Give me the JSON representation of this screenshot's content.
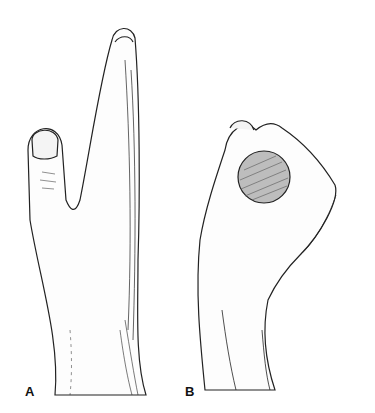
{
  "figure": {
    "panels": [
      {
        "label": "A",
        "description": "Hand with fingers extended flat, thumb abducted"
      },
      {
        "label": "B",
        "description": "Hand grasping a round object between thumb and fingers"
      }
    ],
    "signature": "J.J."
  },
  "colors": {
    "ink": "#222222",
    "background": "#ffffff",
    "object_fill": "#bdbdbd"
  }
}
